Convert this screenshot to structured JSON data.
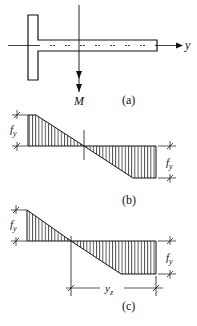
{
  "figure": {
    "panel_a": {
      "label": "(a)",
      "axis_label": "y",
      "moment_label": "M",
      "description": "T-section with horizontal web along y-axis; bending moment vector M pointing downward"
    },
    "panel_b": {
      "label": "(b)",
      "left_dim_label": "f",
      "left_dim_sub": "y",
      "right_dim_label": "f",
      "right_dim_sub": "y",
      "description": "Stress distribution: tension block at top-left with plateau, compression at bottom-right with plateau; neutral axis at section center"
    },
    "panel_c": {
      "label": "(c)",
      "left_dim_label": "f",
      "left_dim_sub": "y",
      "right_dim_label": "f",
      "right_dim_sub": "y",
      "bottom_dim_label": "y",
      "bottom_dim_sub": "z",
      "description": "Stress distribution with shifted neutral axis; y_z distance from neutral axis to web tip"
    }
  },
  "colors": {
    "ink": "#111111",
    "background": "#ffffff"
  }
}
